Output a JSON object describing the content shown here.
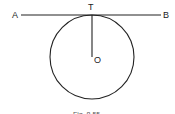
{
  "figure": {
    "labels": {
      "A": "A",
      "B": "B",
      "T": "T",
      "O": "O"
    },
    "caption": "Fig. 8.55",
    "colors": {
      "stroke": "#222222",
      "background": "#ffffff"
    }
  }
}
